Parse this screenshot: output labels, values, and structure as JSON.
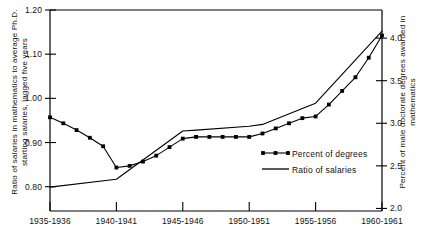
{
  "chart_data": {
    "type": "line",
    "title": "",
    "subtitle": "",
    "xlabel": "",
    "ylabel": "Ratio of salaries in mathematics to average Ph.D. starting salaries, lagged five years",
    "y2label": "Percent of male doctorate degrees awarded in mathematics",
    "grid": false,
    "legend_position": "center-right-inside",
    "x_tick_labels": [
      "1935-1936",
      "1940-1941",
      "1945-1946",
      "1950-1951",
      "1955-1956",
      "1960-1961"
    ],
    "x_tick_values": [
      1935,
      1940,
      1945,
      1950,
      1955,
      1960
    ],
    "xlim": [
      1935,
      1960
    ],
    "y_tick_labels": [
      "0.80",
      "0.90",
      "1.00",
      "1.10",
      "1.20"
    ],
    "y_tick_values": [
      0.8,
      0.9,
      1.0,
      1.1,
      1.2
    ],
    "ylim": [
      0.745,
      1.2
    ],
    "y2_tick_labels": [
      "2.0",
      "2.5",
      "3.0",
      "3.5",
      "4.0"
    ],
    "y2_tick_values": [
      2.0,
      2.5,
      3.0,
      3.5,
      4.0
    ],
    "y2lim": [
      1.97,
      4.33
    ],
    "series": [
      {
        "name": "Percent of degrees",
        "axis": "right",
        "marker": "square",
        "x": [
          1935,
          1936,
          1937,
          1938,
          1939,
          1940,
          1941,
          1942,
          1943,
          1944,
          1945,
          1946,
          1947,
          1948,
          1949,
          1950,
          1951,
          1952,
          1953,
          1954,
          1955,
          1956,
          1957,
          1958,
          1959,
          1960
        ],
        "values": [
          3.07,
          3.0,
          2.92,
          2.83,
          2.73,
          2.48,
          2.5,
          2.55,
          2.62,
          2.72,
          2.82,
          2.84,
          2.84,
          2.84,
          2.84,
          2.84,
          2.88,
          2.94,
          3.0,
          3.06,
          3.08,
          3.22,
          3.38,
          3.54,
          3.77,
          4.03
        ]
      },
      {
        "name": "Ratio of salaries",
        "axis": "left",
        "marker": "none",
        "x": [
          1935,
          1940,
          1945,
          1946,
          1950,
          1951,
          1954,
          1955,
          1960
        ],
        "values": [
          0.799,
          0.817,
          0.926,
          0.928,
          0.937,
          0.941,
          0.977,
          0.989,
          1.152
        ]
      }
    ]
  },
  "legend": {
    "items": [
      {
        "label": "Percent of degrees",
        "marker": "square-line"
      },
      {
        "label": "Ratio of salaries",
        "marker": "line"
      }
    ]
  },
  "colors": {
    "line": "#000000",
    "axis": "#000000",
    "background": "#ffffff",
    "text": "#111111"
  }
}
